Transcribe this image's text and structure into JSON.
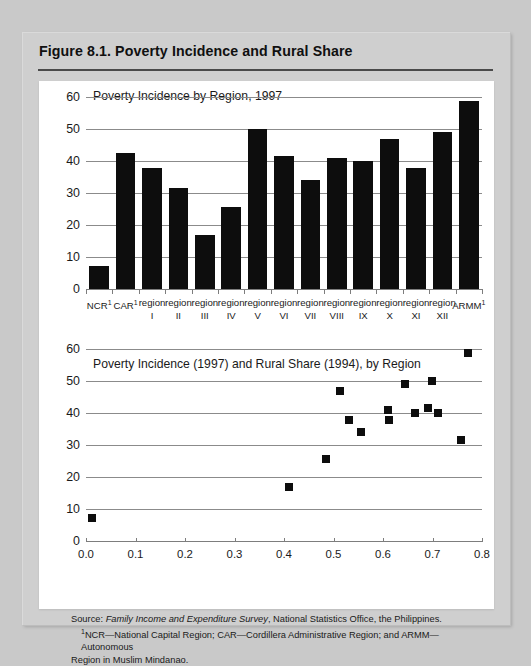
{
  "figure": {
    "title": "Figure 8.1.  Poverty Incidence and Rural Share"
  },
  "notes": {
    "source_label": "Source:",
    "source_italic": "Family Income and Expenditure Survey",
    "source_rest": ", National Statistics Office, the Philippines.",
    "footnote_marker": "1",
    "footnote_line1": "NCR—National Capital Region; CAR—Cordillera Administrative Region; and ARMM—Autonomous",
    "footnote_line2": "Region in Muslim Mindanao."
  },
  "chart_data": [
    {
      "type": "bar",
      "title": "Poverty Incidence by Region, 1997",
      "xlabel": "",
      "ylabel": "",
      "ylim": [
        0,
        60
      ],
      "yticks": [
        0,
        10,
        20,
        30,
        40,
        50,
        60
      ],
      "grid": true,
      "legend": "none",
      "categories": [
        "NCR¹",
        "CAR¹",
        "region I",
        "region II",
        "region III",
        "region IV",
        "region V",
        "region VI",
        "region VII",
        "region VIII",
        "region IX",
        "region X",
        "region XI",
        "region XII",
        "ARMM¹"
      ],
      "category_top": [
        "NCR",
        "CAR",
        "region",
        "region",
        "region",
        "region",
        "region",
        "region",
        "region",
        "region",
        "region",
        "region",
        "region",
        "region",
        "ARMM"
      ],
      "category_sup": [
        "1",
        "1",
        "",
        "",
        "",
        "",
        "",
        "",
        "",
        "",
        "",
        "",
        "",
        "",
        "1"
      ],
      "category_bottom": [
        "",
        "",
        "I",
        "II",
        "III",
        "IV",
        "V",
        "VI",
        "VII",
        "VIII",
        "IX",
        "X",
        "XI",
        "XII",
        ""
      ],
      "values": [
        7.1,
        42.5,
        37.7,
        31.6,
        16.9,
        25.7,
        50.1,
        41.6,
        34.1,
        40.8,
        39.9,
        46.8,
        37.9,
        49.2,
        58.8
      ]
    },
    {
      "type": "scatter",
      "title": "Poverty Incidence (1997) and Rural Share (1994), by Region",
      "xlabel": "",
      "ylabel": "",
      "xlim": [
        0.0,
        0.8
      ],
      "ylim": [
        0,
        60
      ],
      "xticks": [
        0.0,
        0.1,
        0.2,
        0.3,
        0.4,
        0.5,
        0.6,
        0.7,
        0.8
      ],
      "xtick_labels": [
        "0.0",
        "0.1",
        "0.2",
        "0.3",
        "0.4",
        "0.5",
        "0.6",
        "0.7",
        "0.8"
      ],
      "yticks": [
        0,
        10,
        20,
        30,
        40,
        50,
        60
      ],
      "grid": true,
      "legend": "none",
      "points": [
        {
          "label": "NCR",
          "x": 0.012,
          "y": 7.1
        },
        {
          "label": "region III",
          "x": 0.41,
          "y": 16.9
        },
        {
          "label": "region IV",
          "x": 0.484,
          "y": 25.7
        },
        {
          "label": "CAR",
          "x": 0.513,
          "y": 46.8
        },
        {
          "label": "region VI",
          "x": 0.531,
          "y": 37.7
        },
        {
          "label": "region VII",
          "x": 0.556,
          "y": 34.1
        },
        {
          "label": "region XI",
          "x": 0.611,
          "y": 40.8
        },
        {
          "label": "region I",
          "x": 0.613,
          "y": 37.9
        },
        {
          "label": "region II",
          "x": 0.645,
          "y": 49.2
        },
        {
          "label": "region IX",
          "x": 0.665,
          "y": 39.9
        },
        {
          "label": "region V",
          "x": 0.691,
          "y": 41.6
        },
        {
          "label": "region VIII",
          "x": 0.698,
          "y": 50.1
        },
        {
          "label": "region X",
          "x": 0.712,
          "y": 39.9
        },
        {
          "label": "region XII",
          "x": 0.757,
          "y": 31.6
        },
        {
          "label": "ARMM",
          "x": 0.772,
          "y": 58.8
        }
      ]
    }
  ]
}
